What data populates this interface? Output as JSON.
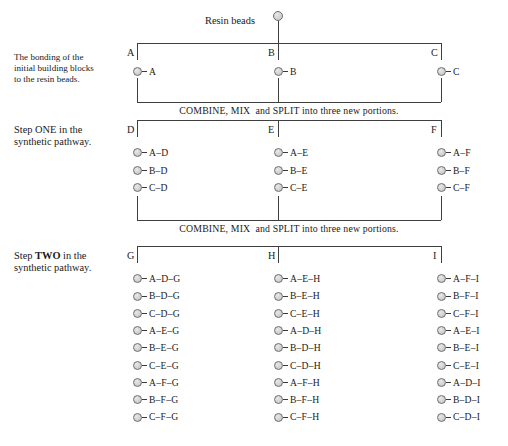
{
  "diagram": {
    "title_label": "Resin beads",
    "combine_text": "COMBINE, MIX  and SPLIT into three new portions.",
    "stages": [
      {
        "id": "initial",
        "caption": "The bonding of the\ninitial building blocks\nto the resin beads.",
        "columns": [
          {
            "letter": "A",
            "items": [
              "A"
            ]
          },
          {
            "letter": "B",
            "items": [
              "B"
            ]
          },
          {
            "letter": "C",
            "items": [
              "C"
            ]
          }
        ]
      },
      {
        "id": "step-one",
        "caption_pre": "Step ",
        "caption_emph": "ONE",
        "caption_post": " in the\nsynthetic pathway.",
        "emph_bold": false,
        "columns": [
          {
            "letter": "D",
            "items": [
              "A–D",
              "B–D",
              "C–D"
            ]
          },
          {
            "letter": "E",
            "items": [
              "A–E",
              "B–E",
              "C–E"
            ]
          },
          {
            "letter": "F",
            "items": [
              "A–F",
              "B–F",
              "C–F"
            ]
          }
        ]
      },
      {
        "id": "step-two",
        "caption_pre": "Step ",
        "caption_emph": "TWO",
        "caption_post": " in the\nsynthetic pathway.",
        "emph_bold": true,
        "columns": [
          {
            "letter": "G",
            "items": [
              "A–D–G",
              "B–D–G",
              "C–D–G",
              "A–E–G",
              "B–E–G",
              "C–E–G",
              "A–F–G",
              "B–F–G",
              "C–F–G"
            ]
          },
          {
            "letter": "H",
            "items": [
              "A–E–H",
              "B–E–H",
              "C–E–H",
              "A–D–H",
              "B–D–H",
              "C–D–H",
              "A–F–H",
              "B–F–H",
              "C–F–H"
            ]
          },
          {
            "letter": "I",
            "items": [
              "A–F–I",
              "B–F–I",
              "C–F–I",
              "A–E–I",
              "B–E–I",
              "C–E–I",
              "A–D–I",
              "B–D–I",
              "C–D–I"
            ]
          }
        ]
      }
    ]
  }
}
